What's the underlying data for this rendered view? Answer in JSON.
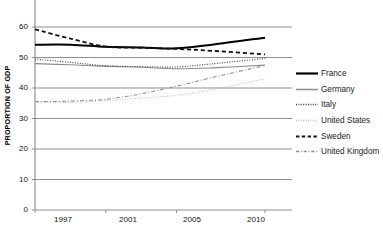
{
  "chart_data": {
    "type": "line",
    "title": "",
    "xlabel": "",
    "ylabel": "PROPORTION OF GDP",
    "x": [
      1997,
      2001,
      2005,
      2010
    ],
    "xtick_labels": [
      "1997",
      "2001",
      "2005",
      "2010"
    ],
    "ytick_labels": [
      "0",
      "10",
      "20",
      "30",
      "40",
      "50",
      "60"
    ],
    "yticks": [
      0,
      10,
      20,
      30,
      40,
      50,
      60
    ],
    "ylim": [
      0,
      60
    ],
    "xlim": [
      1996,
      2011
    ],
    "grid": "horizontal",
    "legend_position": "right",
    "series": [
      {
        "name": "France",
        "style": "solid",
        "width": 2.0,
        "color": "#000000",
        "x": [
          1997,
          1999,
          2001,
          2003,
          2005,
          2007,
          2010
        ],
        "values": [
          54.2,
          54.2,
          53.5,
          53.3,
          53.0,
          54.2,
          56.5
        ]
      },
      {
        "name": "Germany",
        "style": "solid",
        "width": 1.1,
        "color": "#8c8c8c",
        "x": [
          1997,
          1999,
          2001,
          2003,
          2005,
          2007,
          2010
        ],
        "values": [
          48.0,
          47.6,
          47.1,
          46.8,
          46.3,
          46.6,
          47.5
        ]
      },
      {
        "name": "Italy",
        "style": "dotted",
        "width": 1.1,
        "color": "#3c3c3c",
        "x": [
          1997,
          1999,
          2001,
          2003,
          2005,
          2007,
          2010
        ],
        "values": [
          49.5,
          48.4,
          47.3,
          47.0,
          46.9,
          47.9,
          49.7
        ]
      },
      {
        "name": "United States",
        "style": "dotted",
        "width": 1.1,
        "color": "#bdbdbd",
        "x": [
          1997,
          1999,
          2001,
          2003,
          2005,
          2007,
          2010
        ],
        "values": [
          35.4,
          35.3,
          35.8,
          36.7,
          37.6,
          39.4,
          43.0
        ]
      },
      {
        "name": "Sweden",
        "style": "dashed",
        "width": 1.8,
        "color": "#111111",
        "x": [
          1997,
          1999,
          2001,
          2003,
          2005,
          2007,
          2010
        ],
        "values": [
          59.2,
          56.2,
          53.6,
          53.2,
          52.8,
          52.2,
          51.0
        ]
      },
      {
        "name": "United Kingdom",
        "style": "dashdot",
        "width": 1.1,
        "color": "#909090",
        "x": [
          1997,
          1999,
          2001,
          2003,
          2005,
          2007,
          2010
        ],
        "values": [
          35.5,
          35.7,
          36.3,
          38.1,
          40.6,
          43.4,
          47.4
        ]
      }
    ]
  },
  "axis": {
    "y_title": "PROPORTION OF GDP"
  },
  "legend": {
    "items": [
      {
        "label": "France"
      },
      {
        "label": "Germany"
      },
      {
        "label": "Italy"
      },
      {
        "label": "United States"
      },
      {
        "label": "Sweden"
      },
      {
        "label": "United Kingdom"
      }
    ]
  }
}
